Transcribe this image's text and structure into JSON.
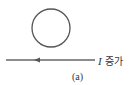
{
  "diagram": {
    "loop": {
      "cx": 51,
      "cy": 28,
      "r": 19,
      "stroke": "#555555"
    },
    "wire": {
      "x1": 6,
      "x2": 95,
      "y": 60,
      "stroke": "#666666",
      "arrow_direction": "left",
      "arrow_x": 38
    },
    "current_label": {
      "symbol": "I",
      "text": "증가"
    },
    "caption": "(a)"
  }
}
